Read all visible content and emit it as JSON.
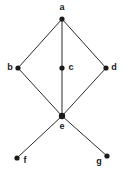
{
  "diagram": {
    "type": "node-link-graph",
    "background_color": "#ffffff",
    "edge_color": "#2b2b2b",
    "vertex_color": "#1a1a1a",
    "label_color": "#1a1a1a",
    "vertices": [
      {
        "id": "a",
        "label": "a",
        "x": 62,
        "y": 19,
        "label_x": 62,
        "label_y": 8,
        "label_anchor": "middle"
      },
      {
        "id": "b",
        "label": "b",
        "x": 18,
        "y": 68,
        "label_x": 10,
        "label_y": 68,
        "label_anchor": "middle"
      },
      {
        "id": "c",
        "label": "c",
        "x": 62,
        "y": 68,
        "label_x": 71,
        "label_y": 68,
        "label_anchor": "middle"
      },
      {
        "id": "d",
        "label": "d",
        "x": 106,
        "y": 68,
        "label_x": 114,
        "label_y": 68,
        "label_anchor": "middle"
      },
      {
        "id": "e",
        "label": "e",
        "x": 62,
        "y": 116,
        "label_x": 62,
        "label_y": 127,
        "label_anchor": "middle"
      },
      {
        "id": "f",
        "label": "f",
        "x": 17,
        "y": 158,
        "label_x": 25,
        "label_y": 161,
        "label_anchor": "middle"
      },
      {
        "id": "g",
        "label": "g",
        "x": 107,
        "y": 156,
        "label_x": 99,
        "label_y": 162,
        "label_anchor": "middle"
      }
    ],
    "edges": [
      {
        "id": "edge-a-b",
        "from": "a",
        "to": "b",
        "x1": 62,
        "y1": 19,
        "x2": 18,
        "y2": 68
      },
      {
        "id": "edge-a-d",
        "from": "a",
        "to": "d",
        "x1": 62,
        "y1": 19,
        "x2": 106,
        "y2": 68
      },
      {
        "id": "edge-a-e",
        "from": "a",
        "to": "e",
        "x1": 62,
        "y1": 19,
        "x2": 62,
        "y2": 116
      },
      {
        "id": "edge-b-e",
        "from": "b",
        "to": "e",
        "x1": 18,
        "y1": 68,
        "x2": 62,
        "y2": 116
      },
      {
        "id": "edge-d-e",
        "from": "d",
        "to": "e",
        "x1": 106,
        "y1": 68,
        "x2": 62,
        "y2": 116
      },
      {
        "id": "edge-e-f",
        "from": "e",
        "to": "f",
        "x1": 62,
        "y1": 116,
        "x2": 17,
        "y2": 158
      },
      {
        "id": "edge-e-g",
        "from": "e",
        "to": "g",
        "x1": 62,
        "y1": 116,
        "x2": 107,
        "y2": 156
      }
    ],
    "vertex_radius": 2.6,
    "hub_vertex_radius": 3.2,
    "hub_vertex_id": "e"
  }
}
